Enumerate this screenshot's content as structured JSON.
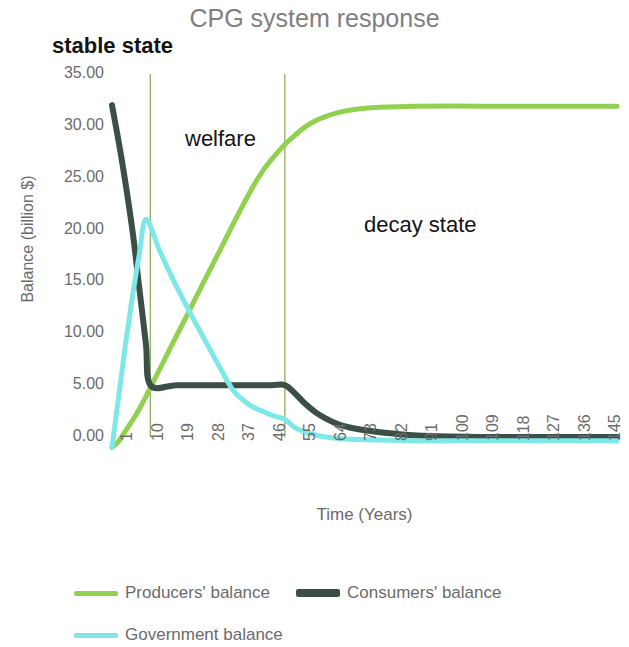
{
  "chart_data": {
    "type": "line",
    "title": "CPG system response",
    "xlabel": "Time (Years)",
    "ylabel": "Balance  (billion $)",
    "xlim": [
      1,
      150
    ],
    "ylim": [
      0,
      35
    ],
    "x_ticks": [
      "1",
      "10",
      "19",
      "28",
      "37",
      "46",
      "55",
      "64",
      "73",
      "82",
      "91",
      "100",
      "109",
      "118",
      "127",
      "136",
      "145"
    ],
    "x_tick_values": [
      1,
      10,
      19,
      28,
      37,
      46,
      55,
      64,
      73,
      82,
      91,
      100,
      109,
      118,
      127,
      136,
      145
    ],
    "y_ticks": [
      "0.00",
      "5.00",
      "10.00",
      "15.00",
      "20.00",
      "25.00",
      "30.00",
      "35.00"
    ],
    "y_tick_values": [
      0,
      5,
      10,
      15,
      20,
      25,
      30,
      35
    ],
    "grid": "vertical-region-dividers-only",
    "legend_position": "bottom-left",
    "series": [
      {
        "name": "Producers' balance",
        "color": "#92d050",
        "width": 5,
        "points": [
          [
            1,
            -1.0
          ],
          [
            3,
            -0.4
          ],
          [
            5,
            0.6
          ],
          [
            8,
            2.1
          ],
          [
            11,
            3.9
          ],
          [
            15,
            6.5
          ],
          [
            19,
            9.1
          ],
          [
            24,
            12.3
          ],
          [
            28,
            14.9
          ],
          [
            33,
            18.1
          ],
          [
            37,
            20.7
          ],
          [
            42,
            23.8
          ],
          [
            46,
            25.9
          ],
          [
            50,
            27.5
          ],
          [
            52,
            28.2
          ],
          [
            55,
            29.1
          ],
          [
            58,
            29.9
          ],
          [
            61,
            30.5
          ],
          [
            64,
            30.9
          ],
          [
            68,
            31.3
          ],
          [
            73,
            31.6
          ],
          [
            80,
            31.8
          ],
          [
            91,
            31.9
          ],
          [
            109,
            31.9
          ],
          [
            127,
            31.9
          ],
          [
            145,
            31.9
          ],
          [
            150,
            31.9
          ]
        ]
      },
      {
        "name": "Consumers' balance",
        "color": "#3b4f47",
        "width": 6,
        "points": [
          [
            1,
            32.0
          ],
          [
            4,
            26.5
          ],
          [
            7,
            20.0
          ],
          [
            9,
            14.5
          ],
          [
            11,
            9.0
          ],
          [
            12.3,
            5.0
          ],
          [
            20,
            5.0
          ],
          [
            30,
            5.0
          ],
          [
            40,
            5.0
          ],
          [
            48,
            5.0
          ],
          [
            52,
            5.0
          ],
          [
            55,
            4.2
          ],
          [
            58,
            3.2
          ],
          [
            61,
            2.4
          ],
          [
            64,
            1.8
          ],
          [
            68,
            1.2
          ],
          [
            73,
            0.8
          ],
          [
            79,
            0.5
          ],
          [
            85,
            0.3
          ],
          [
            91,
            0.15
          ],
          [
            100,
            0.05
          ],
          [
            109,
            0.0
          ],
          [
            127,
            0.0
          ],
          [
            145,
            0.0
          ],
          [
            150,
            0.0
          ]
        ]
      },
      {
        "name": "Government balance",
        "color": "#7ee8e8",
        "width": 5,
        "points": [
          [
            1,
            -1.0
          ],
          [
            3,
            4.0
          ],
          [
            5,
            9.0
          ],
          [
            7,
            13.5
          ],
          [
            9,
            17.5
          ],
          [
            11,
            21.0
          ],
          [
            15,
            18.0
          ],
          [
            19,
            15.2
          ],
          [
            24,
            12.0
          ],
          [
            28,
            9.6
          ],
          [
            33,
            6.6
          ],
          [
            37,
            4.4
          ],
          [
            42,
            3.0
          ],
          [
            46,
            2.4
          ],
          [
            49,
            2.0
          ],
          [
            52,
            1.7
          ],
          [
            55,
            0.9
          ],
          [
            58,
            0.5
          ],
          [
            61,
            0.2
          ],
          [
            64,
            0.0
          ],
          [
            70,
            -0.2
          ],
          [
            79,
            -0.3
          ],
          [
            91,
            -0.35
          ],
          [
            109,
            -0.35
          ],
          [
            127,
            -0.35
          ],
          [
            145,
            -0.35
          ],
          [
            150,
            -0.35
          ]
        ]
      }
    ],
    "region_dividers": [
      {
        "x": 12.3,
        "color": "#8aa65a"
      },
      {
        "x": 52.0,
        "color": "#8aa65a"
      }
    ],
    "annotations": [
      {
        "text": "stable state",
        "style": "bold"
      },
      {
        "text": "welfare",
        "style": "regular"
      },
      {
        "text": "decay state",
        "style": "regular"
      }
    ]
  },
  "title": "CPG system response",
  "annotations": {
    "stable_state": "stable state",
    "welfare": "welfare",
    "decay_state": "decay state"
  },
  "axes": {
    "y_title": "Balance  (billion $)",
    "x_title": "Time (Years)"
  },
  "legend": {
    "producers": "Producers' balance",
    "consumers": "Consumers' balance",
    "government": "Government balance"
  },
  "colors": {
    "producers": "#92d050",
    "consumers": "#3b4f47",
    "government": "#7ee8e8",
    "gridline": "#8aa65a",
    "axis_text": "#6b6b6b",
    "title_text": "#7f7f7f"
  }
}
